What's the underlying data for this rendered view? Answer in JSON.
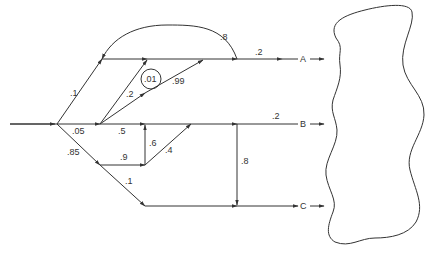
{
  "diagram": {
    "type": "flow-probability-network",
    "stroke_color": "#333333",
    "outputs": [
      {
        "label": "A",
        "prob": ".2"
      },
      {
        "label": "B",
        "prob": ".2"
      },
      {
        "label": "C",
        "prob": ""
      }
    ],
    "edge_labels": {
      "upper_branch": ".1",
      "mid_branch": ".05",
      "lower_branch": ".85",
      "diag_up": ".2",
      "loop_circle": ".01",
      "diag_long": ".99",
      "feedback_arc": ".8",
      "mid_segment": ".5",
      "vertical_up": ".6",
      "lower_segment": ".9",
      "diag_lower": ".4",
      "down_to_c": ".1",
      "b_to_c": ".8",
      "a_out": ".2",
      "b_out": ".2"
    },
    "blob": "irregular-region"
  }
}
